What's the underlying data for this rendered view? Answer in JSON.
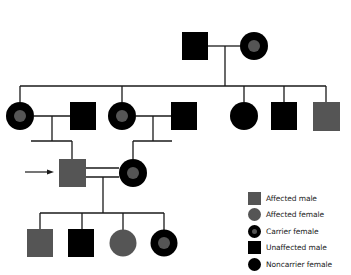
{
  "colors": {
    "affected": "#555555",
    "unaffected": "#000000",
    "line": "#1a1a1a",
    "background": "#ffffff"
  },
  "legend": {
    "items": [
      {
        "symbol": "affected-male",
        "label": "Affected male"
      },
      {
        "symbol": "affected-female",
        "label": "Affected female"
      },
      {
        "symbol": "carrier-female",
        "label": "Carrier female"
      },
      {
        "symbol": "unaffected-male",
        "label": "Unaffected male"
      },
      {
        "symbol": "noncarrier-female",
        "label": "Noncarrier female"
      }
    ]
  },
  "pedigree": {
    "generations": [
      {
        "gen": 1,
        "individuals": [
          "unaffected-male",
          "carrier-female"
        ]
      },
      {
        "gen": 2,
        "individuals": [
          "carrier-female",
          "unaffected-male",
          "carrier-female",
          "unaffected-male",
          "noncarrier-female",
          "unaffected-male",
          "affected-male"
        ]
      },
      {
        "gen": 3,
        "individuals": [
          "affected-male (proband)",
          "carrier-female"
        ],
        "consanguineous": true
      },
      {
        "gen": 4,
        "individuals": [
          "affected-male",
          "unaffected-male",
          "affected-female",
          "carrier-female"
        ]
      }
    ],
    "proband_marker": "arrow"
  }
}
